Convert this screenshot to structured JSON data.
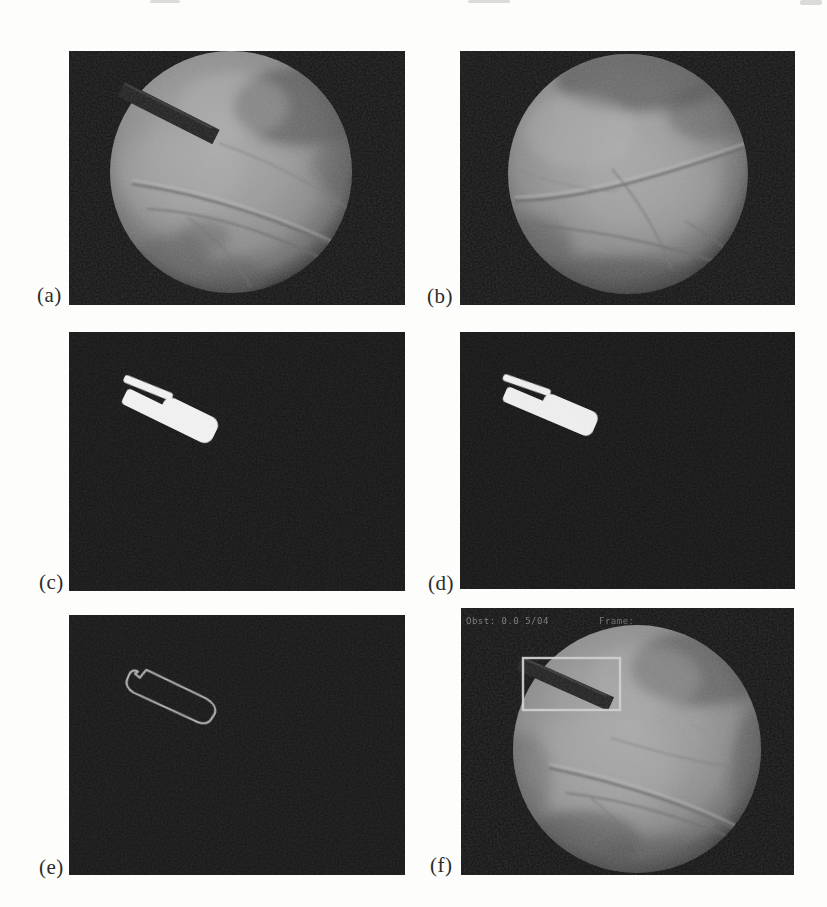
{
  "figure": {
    "panels": [
      {
        "id": "a",
        "label": "(a)"
      },
      {
        "id": "b",
        "label": "(b)"
      },
      {
        "id": "c",
        "label": "(c)"
      },
      {
        "id": "d",
        "label": "(d)"
      },
      {
        "id": "e",
        "label": "(e)"
      },
      {
        "id": "f",
        "label": "(f)",
        "overlay_left": "Obst: 0.0 5/04",
        "overlay_right": "Frame:"
      }
    ],
    "colors": {
      "page_background": "#fdfdfb",
      "panel_background": "#141414",
      "tissue_gray": "#999999",
      "instrument_dark": "#1f1f1f",
      "mask_foreground": "#f3f3f3",
      "contour_stroke": "#b0b0b0",
      "bounding_box": "#d0d0d0",
      "overlay_text_gray": "#828282",
      "label_text": "#2b2b2b"
    }
  }
}
